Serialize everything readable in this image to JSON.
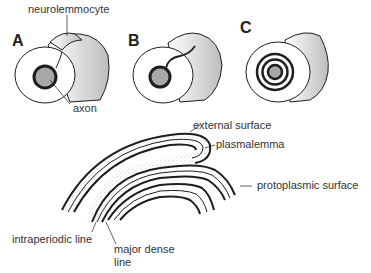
{
  "figure": {
    "panels": [
      {
        "id": "A",
        "label": "A"
      },
      {
        "id": "B",
        "label": "B"
      },
      {
        "id": "C",
        "label": "C"
      }
    ],
    "labels": {
      "neurolemmocyte": "neurolemmocyte",
      "axon": "axon",
      "external_surface": "external surface",
      "plasmalemma": "plasmalemma",
      "protoplasmic_surface": "protoplasmic surface",
      "intraperiodic_line": "intraperiodic line",
      "major_dense_line_1": "major dense",
      "major_dense_line_2": "line"
    },
    "colors": {
      "stroke": "#1e1e1e",
      "axon_fill": "#a8a8a8",
      "stipple": "#c8c8c8",
      "background": "#ffffff"
    }
  }
}
